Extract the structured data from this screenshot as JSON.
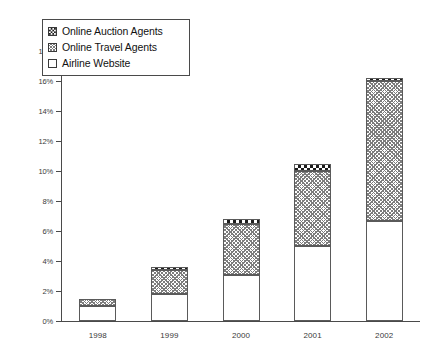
{
  "chart_data": {
    "type": "bar",
    "subtype": "stacked-bar",
    "title": "",
    "xlabel": "",
    "ylabel": "",
    "categories": [
      "1998",
      "1999",
      "2000",
      "2001",
      "2002"
    ],
    "ylim": [
      0,
      18
    ],
    "yunit": "%",
    "yticks": [
      0,
      2,
      4,
      6,
      8,
      10,
      12,
      14,
      16,
      18
    ],
    "ytick_labels": [
      "0%",
      "2%",
      "4%",
      "6%",
      "8%",
      "10%",
      "12%",
      "14%",
      "16%",
      "18%"
    ],
    "grid": false,
    "legend_position": "top-left",
    "stack_order_bottom_to_top": [
      "Airline Website",
      "Online Travel Agents",
      "Online Auction Agents"
    ],
    "series": [
      {
        "name": "Airline Website",
        "pattern": "solid-white",
        "values": [
          1.0,
          1.8,
          3.1,
          5.0,
          6.7
        ]
      },
      {
        "name": "Online Travel Agents",
        "pattern": "fine-cross-hatch",
        "values": [
          0.5,
          1.6,
          3.4,
          5.0,
          9.3
        ]
      },
      {
        "name": "Online Auction Agents",
        "pattern": "checkerboard",
        "values": [
          0.0,
          0.2,
          0.3,
          0.5,
          0.2
        ]
      }
    ],
    "totals": [
      1.5,
      3.6,
      6.8,
      10.5,
      16.2
    ]
  },
  "legend": {
    "items": [
      {
        "label": "Online Auction Agents",
        "swatch": "checkerboard-swatch"
      },
      {
        "label": "Online Travel Agents",
        "swatch": "hatch-swatch"
      },
      {
        "label": "Airline Website",
        "swatch": "white-swatch"
      }
    ]
  },
  "colors": {
    "axis": "#4a4a4a",
    "bar_outline": "#5a5a5a",
    "hatch": "#7d7d7d",
    "checker": "#1d1d1d",
    "background": "#ffffff",
    "text": "#3a3a3a"
  }
}
